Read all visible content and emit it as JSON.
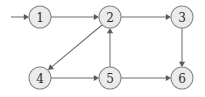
{
  "figure": {
    "type": "directed-graph",
    "width": 205,
    "height": 97,
    "background_color": "#ffffff"
  },
  "style": {
    "node_fill": "#ebebeb",
    "node_stroke": "#8a8a8a",
    "node_radius": 11,
    "edge_color": "#6e6e6e",
    "arrow_color": "#5a5a5a",
    "label_color": "#2b2b2b"
  },
  "nodes": [
    {
      "id": "1",
      "label": "1",
      "cx": 40,
      "cy": 17,
      "r": 11
    },
    {
      "id": "2",
      "label": "2",
      "cx": 110,
      "cy": 17,
      "r": 11
    },
    {
      "id": "3",
      "label": "3",
      "cx": 182,
      "cy": 17,
      "r": 11
    },
    {
      "id": "4",
      "label": "4",
      "cx": 40,
      "cy": 78,
      "r": 11
    },
    {
      "id": "5",
      "label": "5",
      "cx": 110,
      "cy": 78,
      "r": 11
    },
    {
      "id": "6",
      "label": "6",
      "cx": 182,
      "cy": 78,
      "r": 11
    }
  ],
  "edges": [
    {
      "id": "entry-1",
      "from": "external",
      "to": "1",
      "label": "",
      "x1": 11,
      "y1": 17,
      "x2": 29,
      "y2": 17,
      "directed": true
    },
    {
      "id": "1-2",
      "from": "1",
      "to": "2",
      "label": "",
      "x1": 51,
      "y1": 17,
      "x2": 99,
      "y2": 17,
      "directed": true
    },
    {
      "id": "2-3",
      "from": "2",
      "to": "3",
      "label": "",
      "x1": 121,
      "y1": 17,
      "x2": 171,
      "y2": 17,
      "directed": true
    },
    {
      "id": "2-4",
      "from": "2",
      "to": "4",
      "label": "",
      "x1": 102,
      "y1": 25,
      "x2": 48,
      "y2": 70,
      "directed": true
    },
    {
      "id": "5-2",
      "from": "5",
      "to": "2",
      "label": "",
      "x1": 110,
      "y1": 67,
      "x2": 110,
      "y2": 28,
      "directed": true
    },
    {
      "id": "3-6",
      "from": "3",
      "to": "6",
      "label": "",
      "x1": 182,
      "y1": 28,
      "x2": 182,
      "y2": 67,
      "directed": true
    },
    {
      "id": "4-5",
      "from": "4",
      "to": "5",
      "label": "",
      "x1": 51,
      "y1": 78,
      "x2": 99,
      "y2": 78,
      "directed": true
    },
    {
      "id": "5-6",
      "from": "5",
      "to": "6",
      "label": "",
      "x1": 121,
      "y1": 78,
      "x2": 171,
      "y2": 78,
      "directed": true
    }
  ]
}
